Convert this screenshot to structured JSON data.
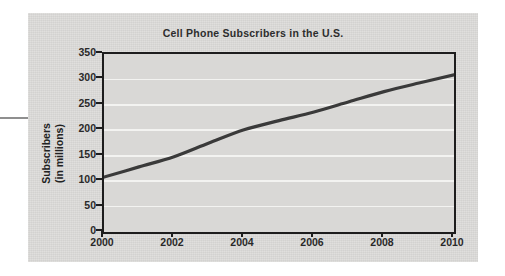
{
  "figure": {
    "title": "Cell Phone Subscribers in the U.S.",
    "panel_color": "#dcdbd9",
    "plot_background": "#d9d8d6",
    "gridline_color": "#f3f3f1",
    "axis_color": "#1d1d1d",
    "line_color": "#3a3a3a"
  },
  "axes": {
    "y_title_line1": "Subscribers",
    "y_title_line2": "(in millions)",
    "x_title": ""
  },
  "chart_data": {
    "type": "line",
    "title": "Cell Phone Subscribers in the U.S.",
    "xlabel": "",
    "ylabel": "Subscribers (in millions)",
    "x": [
      2000,
      2001,
      2002,
      2003,
      2004,
      2005,
      2006,
      2007,
      2008,
      2009,
      2010
    ],
    "values": [
      108,
      128,
      148,
      175,
      201,
      219,
      236,
      256,
      276,
      293,
      309
    ],
    "xlim": [
      2000,
      2010
    ],
    "ylim": [
      0,
      350
    ],
    "xticks": [
      2000,
      2002,
      2004,
      2006,
      2008,
      2010
    ],
    "xticklabels": [
      "2000",
      "2002",
      "2004",
      "2006",
      "2008",
      "2010"
    ],
    "yticks": [
      0,
      50,
      100,
      150,
      200,
      250,
      300,
      350
    ],
    "yticklabels": [
      "0",
      "50",
      "100",
      "150",
      "200",
      "250",
      "300",
      "350"
    ],
    "grid": "horizontal",
    "legend": "none",
    "series": [
      {
        "name": "Cell phone subscribers",
        "values": [
          108,
          128,
          148,
          175,
          201,
          219,
          236,
          256,
          276,
          293,
          309
        ]
      }
    ]
  }
}
